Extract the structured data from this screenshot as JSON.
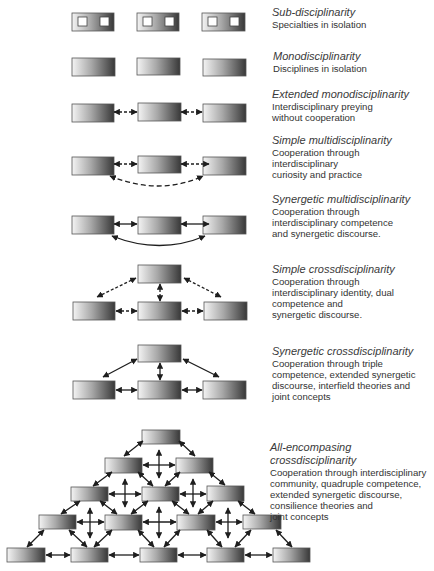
{
  "figure": {
    "levels": [
      {
        "id": "sub",
        "title": "Sub-disciplinarity",
        "desc": "Specialties in isolation",
        "top": 6
      },
      {
        "id": "mono",
        "title": "Monodisciplinarity",
        "desc": "Disciplines in isolation",
        "top": 50
      },
      {
        "id": "ext-mono",
        "title": "Extended monodisciplinarity",
        "desc": "Interdisciplinary preying\nwithout cooperation",
        "top": 84
      },
      {
        "id": "simple-multi",
        "title": "Simple multidisciplinarity",
        "desc": "Cooperation through\ninterdisciplinary\ncuriosity and practice",
        "top": 133
      },
      {
        "id": "syn-multi",
        "title": "Synergetic multidisciplinarity",
        "desc": "Cooperation through\ninterdisciplinary competence\nand synergetic discourse.",
        "top": 192
      },
      {
        "id": "simple-cross",
        "title": "Simple crossdisciplinarity",
        "desc": "Cooperation through\ninterdisciplinary identity, dual\ncompetence and\nsynergetic discourse.",
        "top": 262
      },
      {
        "id": "syn-cross",
        "title": "Synergetic crossdisciplinarity",
        "desc": "Cooperation through triple\ncompetence, extended synergetic\ndiscourse, interfield theories and\njoint concepts",
        "top": 344
      },
      {
        "id": "all-cross",
        "title": "All-encompasing crossdisciplinarity",
        "desc": "Cooperation through interdisciplinary\ncommunity, quadruple competence,\nextended synergetic discourse,\nconsilience theories and\njoint concepts",
        "top": 441
      }
    ],
    "colors": {
      "box_light": "#f2f2f2",
      "box_dark": "#3c3c3c",
      "box_border": "#555555",
      "arrow": "#1e1e1e"
    }
  }
}
